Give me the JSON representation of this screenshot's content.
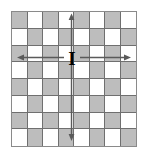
{
  "figure": {
    "kind": "chessboard-move-diagram",
    "piece_symbol": "I",
    "board": {
      "rows": 8,
      "columns": 8,
      "light_color": "#ffffff",
      "shaded_color": "#bdbdbd",
      "grid_line_color": "#6f6f6f",
      "border_color": "#8a8a8a",
      "pattern": [
        [
          "shaded",
          "light",
          "shaded",
          "light",
          "shaded",
          "light",
          "shaded",
          "light"
        ],
        [
          "light",
          "shaded",
          "light",
          "shaded",
          "light",
          "shaded",
          "light",
          "shaded"
        ],
        [
          "shaded",
          "light",
          "shaded",
          "light",
          "shaded",
          "light",
          "shaded",
          "light"
        ],
        [
          "light",
          "shaded",
          "light",
          "shaded",
          "light",
          "shaded",
          "light",
          "shaded"
        ],
        [
          "shaded",
          "light",
          "shaded",
          "light",
          "shaded",
          "light",
          "shaded",
          "light"
        ],
        [
          "light",
          "shaded",
          "light",
          "shaded",
          "light",
          "shaded",
          "light",
          "shaded"
        ],
        [
          "shaded",
          "light",
          "shaded",
          "light",
          "shaded",
          "light",
          "shaded",
          "light"
        ],
        [
          "light",
          "shaded",
          "light",
          "shaded",
          "light",
          "shaded",
          "light",
          "shaded"
        ]
      ]
    },
    "piece": {
      "label": "I",
      "row": 3,
      "column": 4,
      "color": "#000000"
    },
    "arrows": {
      "color": "#5a5a5a",
      "items": [
        {
          "direction": "up",
          "name": "arrow-up"
        },
        {
          "direction": "down",
          "name": "arrow-down"
        },
        {
          "direction": "left",
          "name": "arrow-left"
        },
        {
          "direction": "right",
          "name": "arrow-right"
        }
      ]
    }
  }
}
